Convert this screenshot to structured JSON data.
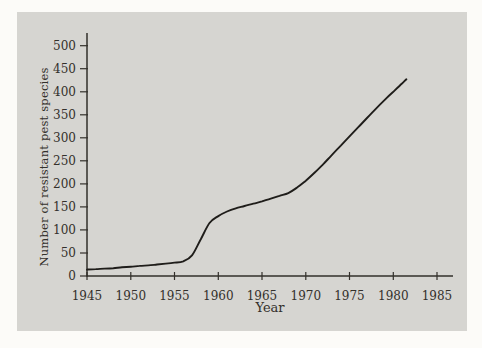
{
  "figure": {
    "page_color": "#fcfbf8",
    "panel_color": "#d6d5d1",
    "ink_color": "#33302b",
    "line_color": "#1f1d1a"
  },
  "chart_data": {
    "type": "line",
    "title": "",
    "xlabel": "Year",
    "ylabel": "Number of resistant pest species",
    "x_ticks": [
      1945,
      1950,
      1955,
      1960,
      1965,
      1970,
      1975,
      1980,
      1985
    ],
    "y_ticks": [
      0,
      50,
      100,
      150,
      200,
      250,
      300,
      350,
      400,
      450,
      500
    ],
    "xlim": [
      1945,
      1987
    ],
    "ylim": [
      0,
      530
    ],
    "grid": false,
    "legend_position": "none",
    "series": [
      {
        "name": "resistant pest species",
        "x": [
          1945,
          1946,
          1947,
          1948,
          1949,
          1950,
          1951,
          1952,
          1953,
          1954,
          1955,
          1956,
          1957,
          1958,
          1959,
          1960,
          1961,
          1962,
          1963,
          1964,
          1965,
          1966,
          1967,
          1968,
          1969,
          1970,
          1971,
          1972,
          1973,
          1974,
          1975,
          1976,
          1977,
          1978,
          1979,
          1980,
          1981,
          1981.5
        ],
        "y": [
          14,
          15,
          16,
          17,
          19,
          20,
          22,
          23,
          25,
          27,
          29,
          32,
          45,
          80,
          115,
          130,
          140,
          147,
          152,
          157,
          162,
          168,
          174,
          180,
          192,
          207,
          224,
          243,
          263,
          283,
          303,
          323,
          343,
          363,
          382,
          400,
          418,
          427
        ]
      }
    ]
  }
}
